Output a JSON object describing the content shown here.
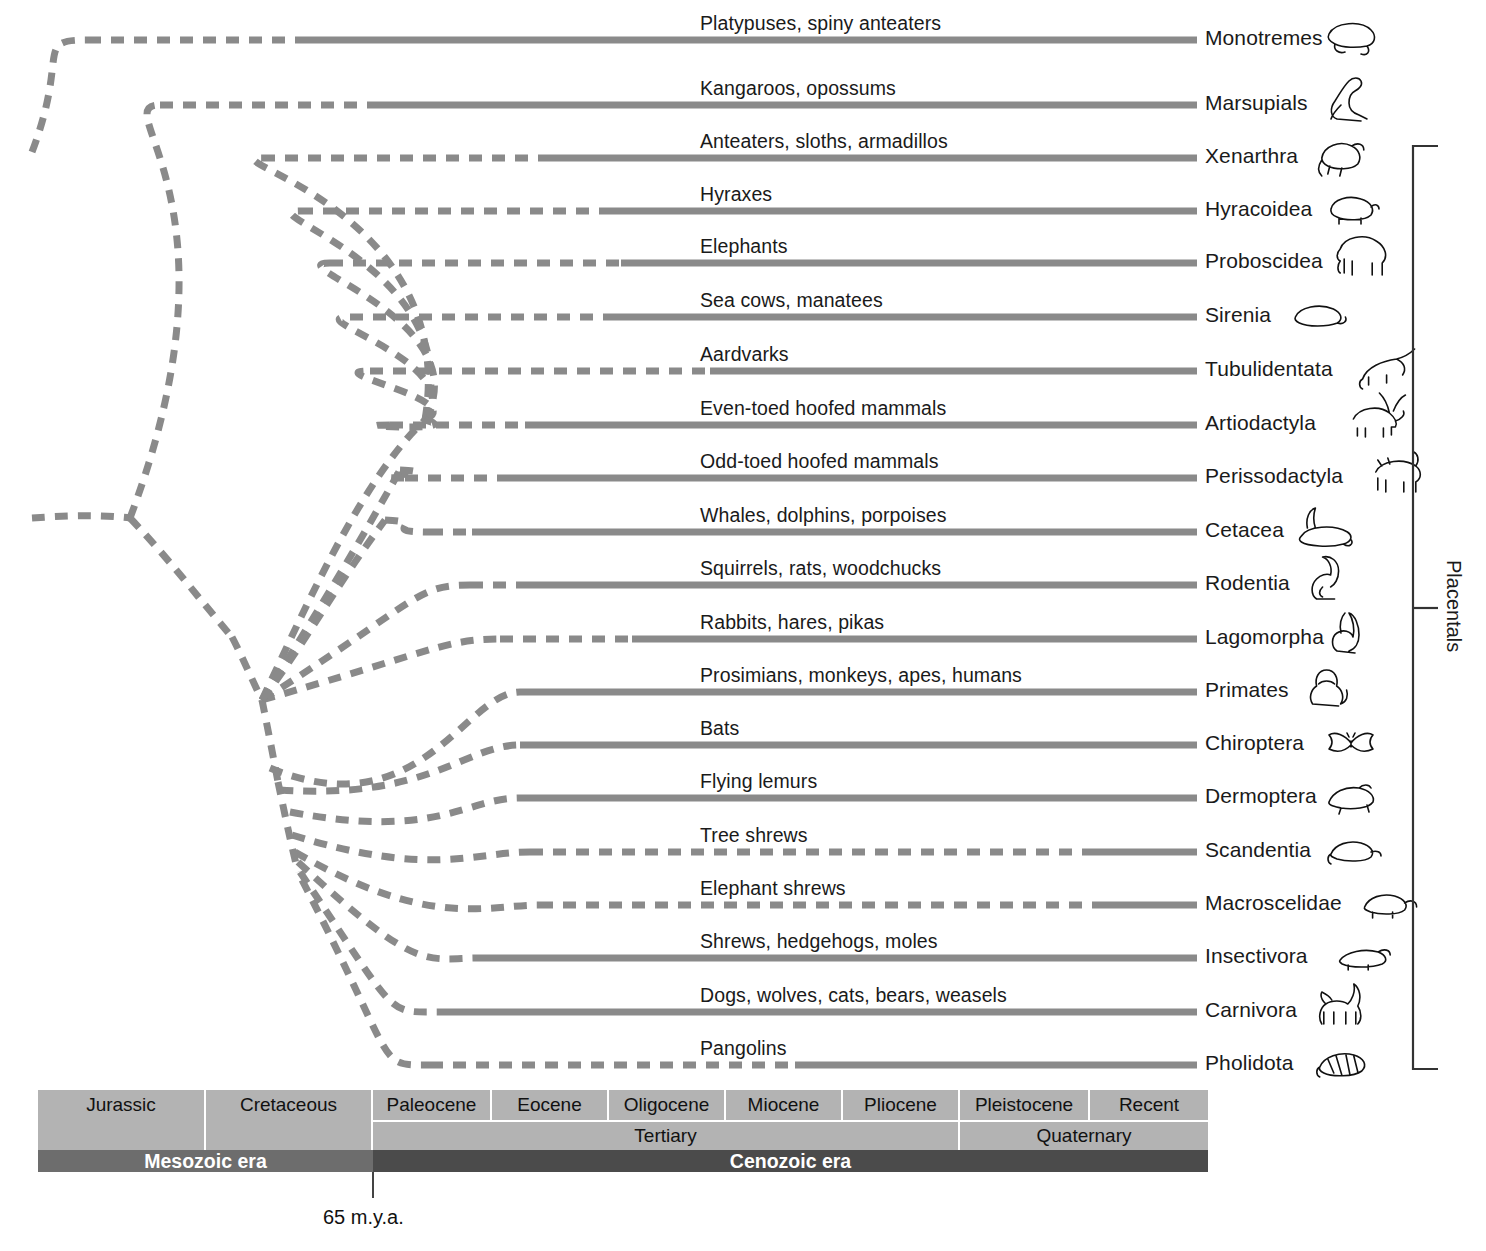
{
  "diagram": {
    "bracket_label": "Placentals",
    "boundary_label": "65 m.y.a."
  },
  "colors": {
    "branch": "#8a8a8a",
    "timescale_light": "#b3b3b3",
    "mesozoic": "#6d6d6d",
    "cenozoic": "#4b4b4b",
    "text": "#1a1a1a",
    "tick": "#444444"
  },
  "taxa": [
    {
      "common": "Platypuses, spiny anteaters",
      "order": "Monotremes",
      "icon": "platypus-icon"
    },
    {
      "common": "Kangaroos, opossums",
      "order": "Marsupials",
      "icon": "kangaroo-icon"
    },
    {
      "common": "Anteaters, sloths, armadillos",
      "order": "Xenarthra",
      "icon": "armadillo-icon"
    },
    {
      "common": "Hyraxes",
      "order": "Hyracoidea",
      "icon": "hyrax-icon"
    },
    {
      "common": "Elephants",
      "order": "Proboscidea",
      "icon": "elephant-icon"
    },
    {
      "common": "Sea cows, manatees",
      "order": "Sirenia",
      "icon": "manatee-icon"
    },
    {
      "common": "Aardvarks",
      "order": "Tubulidentata",
      "icon": "aardvark-icon"
    },
    {
      "common": "Even-toed hoofed mammals",
      "order": "Artiodactyla",
      "icon": "deer-icon"
    },
    {
      "common": "Odd-toed hoofed mammals",
      "order": "Perissodactyla",
      "icon": "rhino-icon"
    },
    {
      "common": "Whales, dolphins, porpoises",
      "order": "Cetacea",
      "icon": "whale-icon"
    },
    {
      "common": "Squirrels, rats, woodchucks",
      "order": "Rodentia",
      "icon": "squirrel-icon"
    },
    {
      "common": "Rabbits, hares, pikas",
      "order": "Lagomorpha",
      "icon": "rabbit-icon"
    },
    {
      "common": "Prosimians, monkeys, apes, humans",
      "order": "Primates",
      "icon": "monkey-icon"
    },
    {
      "common": "Bats",
      "order": "Chiroptera",
      "icon": "bat-icon"
    },
    {
      "common": "Flying lemurs",
      "order": "Dermoptera",
      "icon": "colugo-icon"
    },
    {
      "common": "Tree shrews",
      "order": "Scandentia",
      "icon": "treeshrew-icon"
    },
    {
      "common": "Elephant shrews",
      "order": "Macroscelidae",
      "icon": "elephantshrew-icon"
    },
    {
      "common": "Shrews, hedgehogs, moles",
      "order": "Insectivora",
      "icon": "shrew-icon"
    },
    {
      "common": "Dogs, wolves, cats, bears, weasels",
      "order": "Carnivora",
      "icon": "dog-icon"
    },
    {
      "common": "Pangolins",
      "order": "Pholidota",
      "icon": "pangolin-icon"
    }
  ],
  "timescale": {
    "periods": [
      {
        "label": "Jurassic",
        "start": 0,
        "width": 168
      },
      {
        "label": "Cretaceous",
        "start": 168,
        "width": 167
      },
      {
        "label": "Paleocene",
        "start": 335,
        "width": 119
      },
      {
        "label": "Eocene",
        "start": 454,
        "width": 117
      },
      {
        "label": "Oligocene",
        "start": 571,
        "width": 117
      },
      {
        "label": "Miocene",
        "start": 688,
        "width": 117
      },
      {
        "label": "Pliocene",
        "start": 805,
        "width": 117
      },
      {
        "label": "Pleistocene",
        "start": 922,
        "width": 130
      },
      {
        "label": "Recent",
        "start": 1052,
        "width": 118
      }
    ],
    "systems": [
      {
        "label": "",
        "start": 0,
        "width": 168,
        "notop": true
      },
      {
        "label": "",
        "start": 168,
        "width": 167,
        "notop": true
      },
      {
        "label": "Tertiary",
        "start": 335,
        "width": 587,
        "notop": false
      },
      {
        "label": "Quaternary",
        "start": 922,
        "width": 248,
        "notop": false
      }
    ],
    "eras": [
      {
        "label": "Mesozoic era",
        "start": 0,
        "width": 335
      },
      {
        "label": "Cenozoic era",
        "start": 335,
        "width": 835
      }
    ]
  }
}
